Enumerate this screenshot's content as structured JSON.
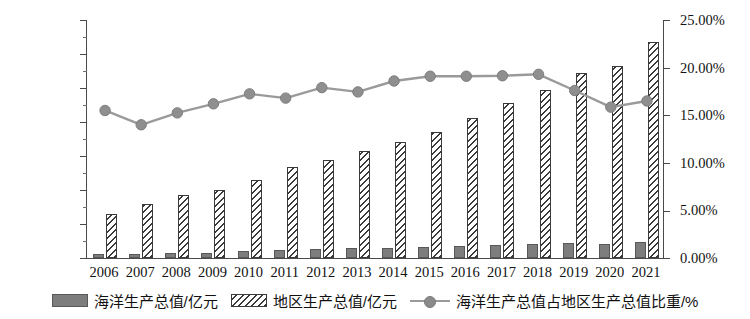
{
  "chart_data": {
    "type": "bar",
    "title": "",
    "subtitle": "",
    "xlabel": "",
    "ylabel": "",
    "grid": false,
    "legend_position": "bottom",
    "categories": [
      "2006",
      "2007",
      "2008",
      "2009",
      "2010",
      "2011",
      "2012",
      "2013",
      "2014",
      "2015",
      "2016",
      "2017",
      "2018",
      "2019",
      "2020",
      "2021"
    ],
    "axes": {
      "left": {
        "label": "",
        "min": 0,
        "max": 140000,
        "step": 20000,
        "ticks": [
          "0",
          "20000",
          "40000",
          "60000",
          "80000",
          "100000",
          "120000",
          "140000"
        ]
      },
      "right": {
        "label": "",
        "min": 0,
        "max": 25,
        "step": 5,
        "ticks": [
          "0.00%",
          "5.00%",
          "10.00%",
          "15.00%",
          "20.00%",
          "25.00%"
        ]
      }
    },
    "series": [
      {
        "name": "海洋生产总值/亿元",
        "type": "bar",
        "axis": "left",
        "style": "solid",
        "color": "#7d7d7d",
        "values": [
          2100,
          2500,
          2900,
          3200,
          4000,
          4600,
          5100,
          5600,
          6000,
          6500,
          7000,
          7600,
          8300,
          8900,
          8000,
          9400
        ]
      },
      {
        "name": "地区生产总值/亿元",
        "type": "bar",
        "axis": "left",
        "style": "hatched",
        "color": "#3a3a3a",
        "values": [
          26000,
          31500,
          37000,
          39800,
          46000,
          53500,
          57800,
          63000,
          68500,
          74200,
          82500,
          91000,
          98800,
          109000,
          113200,
          127000
        ]
      },
      {
        "name": "海洋生产总值占地区生产总值比重/%",
        "type": "line",
        "axis": "right",
        "color": "#9a9a9a",
        "marker": "circle",
        "values": [
          15.6,
          14.1,
          15.35,
          16.3,
          17.35,
          16.9,
          18.0,
          17.55,
          18.7,
          19.2,
          19.2,
          19.25,
          19.4,
          17.7,
          15.95,
          16.6
        ]
      }
    ]
  },
  "legend": {
    "items": [
      {
        "label": "海洋生产总值/亿元",
        "swatch": "solid-bar-swatch"
      },
      {
        "label": "地区生产总值/亿元",
        "swatch": "hatched-bar-swatch"
      },
      {
        "label": "海洋生产总值占地区生产总值比重/%",
        "swatch": "line-marker-swatch"
      }
    ]
  }
}
